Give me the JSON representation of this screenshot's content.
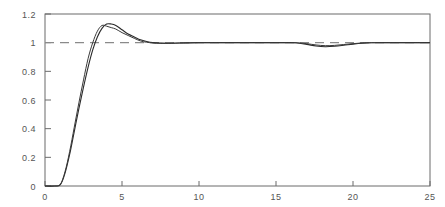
{
  "chart_data": {
    "type": "line",
    "title": "",
    "subtitle": "",
    "xlabel": "",
    "ylabel": "",
    "xlim": [
      0,
      25
    ],
    "ylim": [
      0,
      1.2
    ],
    "grid": false,
    "legend": "none",
    "background_color": "#ffffff",
    "axis_color": "#6b6b6b",
    "x_ticks": [
      0,
      5,
      10,
      15,
      20,
      25
    ],
    "x_tick_labels": [
      "0",
      "5",
      "10",
      "15",
      "20",
      "25"
    ],
    "y_ticks": [
      0,
      0.2,
      0.4,
      0.6,
      0.8,
      1,
      1.2
    ],
    "y_tick_labels": [
      "0",
      "0.2",
      "0.4",
      "0.6",
      "0.8",
      "1",
      "1.2"
    ],
    "annotations": [],
    "reference_lines": [
      {
        "name": "setpoint",
        "orientation": "horizontal",
        "value": 1,
        "style": "dashed",
        "color": "#8a8a8a"
      }
    ],
    "series": [
      {
        "name": "response-1",
        "color": "#2a2a2a",
        "style": "solid",
        "x": [
          0,
          0.6,
          1.0,
          1.3,
          1.6,
          1.9,
          2.2,
          2.5,
          2.8,
          3.1,
          3.4,
          3.7,
          4.0,
          4.3,
          4.6,
          5.0,
          5.4,
          5.8,
          6.2,
          6.6,
          7.0,
          7.5,
          8.0,
          9.0,
          10.0,
          12.0,
          14.0,
          15.5,
          16.3,
          17.0,
          17.6,
          18.2,
          18.8,
          19.4,
          20.0,
          20.6,
          21.2,
          22.0,
          23.0,
          24.0,
          25.0
        ],
        "y": [
          0,
          0,
          0.01,
          0.09,
          0.22,
          0.38,
          0.54,
          0.69,
          0.83,
          0.95,
          1.04,
          1.1,
          1.13,
          1.13,
          1.12,
          1.09,
          1.06,
          1.04,
          1.02,
          1.008,
          1.0,
          0.997,
          0.996,
          0.998,
          1.0,
          1.0,
          1.0,
          1.0,
          0.999,
          0.988,
          0.977,
          0.972,
          0.975,
          0.982,
          0.99,
          0.996,
          0.999,
          1.0,
          1.0,
          1.0,
          1.0
        ]
      },
      {
        "name": "response-2",
        "color": "#3a3a3a",
        "style": "solid",
        "x": [
          0,
          0.6,
          1.0,
          1.3,
          1.6,
          1.9,
          2.2,
          2.5,
          2.8,
          3.1,
          3.4,
          3.7,
          4.0,
          4.3,
          4.6,
          5.0,
          5.4,
          5.8,
          6.2,
          6.6,
          7.0,
          7.5,
          8.0,
          9.0,
          10.0,
          12.0,
          14.0,
          15.5,
          16.3,
          17.0,
          17.6,
          18.2,
          18.8,
          19.4,
          20.0,
          20.6,
          21.2,
          22.0,
          23.0,
          24.0,
          25.0
        ],
        "y": [
          0,
          0,
          0.012,
          0.1,
          0.24,
          0.41,
          0.58,
          0.74,
          0.89,
          1.0,
          1.08,
          1.12,
          1.115,
          1.105,
          1.095,
          1.07,
          1.05,
          1.03,
          1.012,
          1.003,
          0.998,
          0.995,
          0.995,
          0.998,
          1.0,
          1.0,
          1.0,
          1.0,
          0.999,
          0.993,
          0.984,
          0.979,
          0.981,
          0.987,
          0.993,
          0.998,
          1.0,
          1.0,
          1.0,
          1.0,
          1.0
        ]
      }
    ]
  },
  "plot_geometry": {
    "left_px": 45,
    "right_px": 430,
    "top_px": 14,
    "bottom_px": 186
  }
}
